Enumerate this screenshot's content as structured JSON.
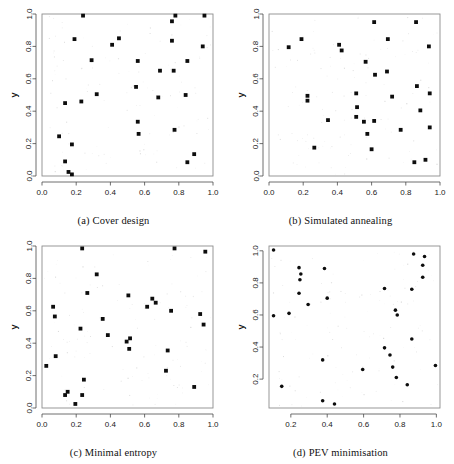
{
  "figure": {
    "layout": "2x2 grid of scatter plots",
    "panels": [
      {
        "id": "a",
        "tag": "(a)",
        "caption": "Cover design",
        "xlabel": "x",
        "ylabel": "y"
      },
      {
        "id": "b",
        "tag": "(b)",
        "caption": "Simulated annealing",
        "xlabel": "x",
        "ylabel": "y"
      },
      {
        "id": "c",
        "tag": "(c)",
        "caption": "Minimal entropy",
        "xlabel": "x",
        "ylabel": "y"
      },
      {
        "id": "d",
        "tag": "(d)",
        "caption": "PEV minimisation",
        "xlabel": "x",
        "ylabel": "y"
      }
    ]
  },
  "chart_data": [
    {
      "type": "scatter",
      "title": "(a) Cover design",
      "xlabel": "x",
      "ylabel": "y",
      "xlim": [
        0.0,
        1.0
      ],
      "ylim": [
        0.0,
        1.0
      ],
      "xticks": [
        "0.0",
        "0.2",
        "0.4",
        "0.6",
        "0.8",
        "1.0"
      ],
      "yticks": [
        "0.0",
        "0.2",
        "0.4",
        "0.6",
        "0.8",
        "1.0"
      ],
      "xtick_values": [
        0.0,
        0.2,
        0.4,
        0.6,
        0.8,
        1.0
      ],
      "ytick_values": [
        0.0,
        0.2,
        0.4,
        0.6,
        0.8,
        1.0
      ],
      "grid": false,
      "legend": null,
      "marker": "filled-square",
      "marker_color": "#0d0d0d",
      "points": [
        [
          0.24,
          0.99
        ],
        [
          0.78,
          0.99
        ],
        [
          0.95,
          0.99
        ],
        [
          0.76,
          0.955
        ],
        [
          0.19,
          0.845
        ],
        [
          0.45,
          0.85
        ],
        [
          0.76,
          0.835
        ],
        [
          0.41,
          0.81
        ],
        [
          0.94,
          0.8
        ],
        [
          0.29,
          0.715
        ],
        [
          0.56,
          0.71
        ],
        [
          0.85,
          0.71
        ],
        [
          0.69,
          0.65
        ],
        [
          0.77,
          0.65
        ],
        [
          0.55,
          0.55
        ],
        [
          0.32,
          0.505
        ],
        [
          0.84,
          0.5
        ],
        [
          0.68,
          0.485
        ],
        [
          0.23,
          0.46
        ],
        [
          0.135,
          0.45
        ],
        [
          0.56,
          0.335
        ],
        [
          0.775,
          0.285
        ],
        [
          0.565,
          0.26
        ],
        [
          0.1,
          0.245
        ],
        [
          0.175,
          0.195
        ],
        [
          0.89,
          0.135
        ],
        [
          0.85,
          0.085
        ],
        [
          0.135,
          0.09
        ],
        [
          0.155,
          0.025
        ],
        [
          0.175,
          0.01
        ]
      ]
    },
    {
      "type": "scatter",
      "title": "(b) Simulated annealing",
      "xlabel": "x",
      "ylabel": "y",
      "xlim": [
        0.0,
        1.0
      ],
      "ylim": [
        0.0,
        1.0
      ],
      "xticks": [
        "0.0",
        "0.2",
        "0.4",
        "0.6",
        "0.8",
        "1.0"
      ],
      "yticks": [
        "0.0",
        "0.2",
        "0.4",
        "0.6",
        "0.8",
        "1.0"
      ],
      "xtick_values": [
        0.0,
        0.2,
        0.4,
        0.6,
        0.8,
        1.0
      ],
      "ytick_values": [
        0.0,
        0.2,
        0.4,
        0.6,
        0.8,
        1.0
      ],
      "grid": false,
      "legend": null,
      "marker": "filled-square",
      "marker_color": "#0d0d0d",
      "points": [
        [
          0.615,
          0.95
        ],
        [
          0.86,
          0.95
        ],
        [
          0.19,
          0.845
        ],
        [
          0.695,
          0.845
        ],
        [
          0.115,
          0.795
        ],
        [
          0.41,
          0.81
        ],
        [
          0.425,
          0.775
        ],
        [
          0.935,
          0.8
        ],
        [
          0.565,
          0.705
        ],
        [
          0.69,
          0.645
        ],
        [
          0.62,
          0.625
        ],
        [
          0.865,
          0.555
        ],
        [
          0.225,
          0.495
        ],
        [
          0.51,
          0.51
        ],
        [
          0.72,
          0.49
        ],
        [
          0.94,
          0.51
        ],
        [
          0.225,
          0.465
        ],
        [
          0.515,
          0.425
        ],
        [
          0.885,
          0.405
        ],
        [
          0.51,
          0.365
        ],
        [
          0.345,
          0.345
        ],
        [
          0.555,
          0.335
        ],
        [
          0.615,
          0.34
        ],
        [
          0.94,
          0.3
        ],
        [
          0.77,
          0.285
        ],
        [
          0.575,
          0.26
        ],
        [
          0.265,
          0.175
        ],
        [
          0.6,
          0.165
        ],
        [
          0.915,
          0.1
        ],
        [
          0.85,
          0.085
        ]
      ]
    },
    {
      "type": "scatter",
      "title": "(c) Minimal entropy",
      "xlabel": "x",
      "ylabel": "y",
      "xlim": [
        0.0,
        1.0
      ],
      "ylim": [
        0.0,
        1.0
      ],
      "xticks": [
        "0.0",
        "0.2",
        "0.4",
        "0.6",
        "0.8",
        "1.0"
      ],
      "yticks": [
        "0.0",
        "0.2",
        "0.4",
        "0.6",
        "0.8",
        "1.0"
      ],
      "xtick_values": [
        0.0,
        0.2,
        0.4,
        0.6,
        0.8,
        1.0
      ],
      "ytick_values": [
        0.0,
        0.2,
        0.4,
        0.6,
        0.8,
        1.0
      ],
      "grid": false,
      "legend": null,
      "marker": "filled-square",
      "marker_color": "#0d0d0d",
      "points": [
        [
          0.235,
          0.985
        ],
        [
          0.775,
          0.985
        ],
        [
          0.955,
          0.965
        ],
        [
          0.32,
          0.825
        ],
        [
          0.265,
          0.71
        ],
        [
          0.505,
          0.695
        ],
        [
          0.645,
          0.675
        ],
        [
          0.665,
          0.65
        ],
        [
          0.065,
          0.625
        ],
        [
          0.615,
          0.625
        ],
        [
          0.755,
          0.6
        ],
        [
          0.925,
          0.58
        ],
        [
          0.075,
          0.565
        ],
        [
          0.355,
          0.55
        ],
        [
          0.945,
          0.515
        ],
        [
          0.225,
          0.49
        ],
        [
          0.385,
          0.45
        ],
        [
          0.515,
          0.43
        ],
        [
          0.495,
          0.41
        ],
        [
          0.51,
          0.365
        ],
        [
          0.735,
          0.355
        ],
        [
          0.08,
          0.32
        ],
        [
          0.025,
          0.26
        ],
        [
          0.725,
          0.23
        ],
        [
          0.245,
          0.175
        ],
        [
          0.89,
          0.13
        ],
        [
          0.15,
          0.1
        ],
        [
          0.135,
          0.08
        ],
        [
          0.235,
          0.08
        ],
        [
          0.195,
          0.025
        ]
      ]
    },
    {
      "type": "scatter",
      "title": "(d) PEV minimisation",
      "xlabel": "x",
      "ylabel": "y",
      "xlim": [
        0.08,
        1.02
      ],
      "ylim": [
        0.02,
        1.03
      ],
      "xticks": [
        "0.2",
        "0.4",
        "0.6",
        "0.8",
        "1.0"
      ],
      "yticks": [
        "0.2",
        "0.4",
        "0.6",
        "0.8",
        "1.0"
      ],
      "xtick_values": [
        0.2,
        0.4,
        0.6,
        0.8,
        1.0
      ],
      "ytick_values": [
        0.2,
        0.4,
        0.6,
        0.8,
        1.0
      ],
      "grid": false,
      "legend": null,
      "marker": "filled-circle",
      "marker_color": "#0d0d0d",
      "points": [
        [
          0.105,
          1.005
        ],
        [
          0.875,
          0.98
        ],
        [
          0.935,
          0.965
        ],
        [
          0.925,
          0.91
        ],
        [
          0.245,
          0.895
        ],
        [
          0.385,
          0.89
        ],
        [
          0.255,
          0.855
        ],
        [
          0.925,
          0.835
        ],
        [
          0.25,
          0.82
        ],
        [
          0.865,
          0.76
        ],
        [
          0.715,
          0.765
        ],
        [
          0.245,
          0.735
        ],
        [
          0.4,
          0.705
        ],
        [
          0.295,
          0.665
        ],
        [
          0.775,
          0.63
        ],
        [
          0.19,
          0.61
        ],
        [
          0.785,
          0.6
        ],
        [
          0.105,
          0.595
        ],
        [
          0.865,
          0.45
        ],
        [
          0.715,
          0.395
        ],
        [
          0.745,
          0.35
        ],
        [
          0.375,
          0.32
        ],
        [
          0.995,
          0.285
        ],
        [
          0.595,
          0.26
        ],
        [
          0.76,
          0.275
        ],
        [
          0.78,
          0.21
        ],
        [
          0.84,
          0.165
        ],
        [
          0.15,
          0.155
        ],
        [
          0.375,
          0.065
        ],
        [
          0.44,
          0.045
        ]
      ]
    }
  ]
}
